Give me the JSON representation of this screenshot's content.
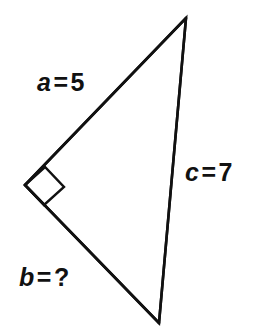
{
  "figure": {
    "kind": "right-triangle-diagram",
    "background_color": "#ffffff",
    "stroke_color": "#111111",
    "stroke_width": 2.6,
    "canvas": {
      "width": 255,
      "height": 329
    },
    "vertices": {
      "apex": {
        "name": "top-vertex",
        "x": 186,
        "y": 18
      },
      "right_angle": {
        "name": "left-vertex",
        "x": 25,
        "y": 185
      },
      "bottom": {
        "name": "bottom-vertex",
        "x": 159,
        "y": 323
      }
    },
    "right_angle_marker": {
      "name": "right-angle-square",
      "at_vertex": "left-vertex",
      "points": "25,185 45,167 64,187 44,205"
    },
    "sides": [
      {
        "id": "a",
        "name": "side-a",
        "from": "left-vertex",
        "to": "top-vertex",
        "role": "leg",
        "label": {
          "variable": "a",
          "relation": "=",
          "value": "5"
        },
        "label_text": "a = 5"
      },
      {
        "id": "c",
        "name": "side-c",
        "from": "top-vertex",
        "to": "bottom-vertex",
        "role": "hypotenuse",
        "label": {
          "variable": "c",
          "relation": "=",
          "value": "7"
        },
        "label_text": "c = 7"
      },
      {
        "id": "b",
        "name": "side-b",
        "from": "left-vertex",
        "to": "bottom-vertex",
        "role": "leg",
        "label": {
          "variable": "b",
          "relation": "=",
          "value": "?"
        },
        "label_text": "b = ?"
      }
    ]
  }
}
